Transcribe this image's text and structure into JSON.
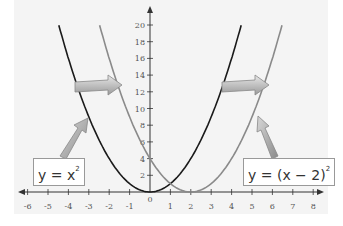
{
  "chart_data": {
    "type": "line",
    "title": "",
    "xlabel": "",
    "ylabel": "",
    "xlim": [
      -6,
      8
    ],
    "ylim": [
      0,
      20
    ],
    "x_ticks": [
      "-6",
      "-5",
      "-4",
      "-3",
      "-2",
      "-1",
      "0",
      "1",
      "2",
      "3",
      "4",
      "5",
      "6",
      "7",
      "8"
    ],
    "y_ticks": [
      "2",
      "4",
      "6",
      "8",
      "10",
      "12",
      "14",
      "16",
      "18",
      "20"
    ],
    "grid": false,
    "series": [
      {
        "name": "y = x^2",
        "color": "#1a1a1a",
        "formula": "x^2",
        "x_range": [
          -4.47,
          4.47
        ]
      },
      {
        "name": "y = (x - 2)^2",
        "color": "#8a8a8a",
        "formula": "(x-2)^2",
        "x_range": [
          -2.47,
          6.47
        ]
      }
    ],
    "annotations": [
      {
        "text_base": "y = x",
        "sup": "2",
        "points_to": "black parabola"
      },
      {
        "text_base": "y = (x − 2)",
        "sup": "2",
        "points_to": "gray parabola"
      },
      {
        "type": "arrow",
        "description": "horizontal shift arrows pointing right by 2 units"
      }
    ]
  },
  "labels": {
    "left": {
      "base": "y = x",
      "sup": "2"
    },
    "right": {
      "base": "y = (x − 2)",
      "sup": "2"
    }
  }
}
